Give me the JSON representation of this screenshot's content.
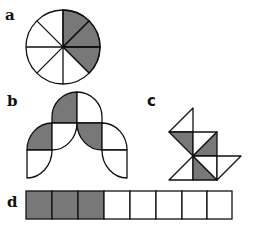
{
  "colors": {
    "shade": "#787878",
    "stroke": "#111111",
    "blank": "#ffffff"
  },
  "figures": [
    {
      "label": "a",
      "shape": "circle divided into 8 equal sectors",
      "total_parts": 8,
      "shaded_parts": 3
    },
    {
      "label": "b",
      "shape": "arched figure of quarter-circle pieces",
      "total_parts": 8,
      "shaded_parts": 3
    },
    {
      "label": "c",
      "shape": "figure of right isosceles triangles",
      "total_parts": 8,
      "shaded_parts": 3
    },
    {
      "label": "d",
      "shape": "rectangle divided into 8 equal squares",
      "total_parts": 8,
      "shaded_parts": 3
    }
  ]
}
